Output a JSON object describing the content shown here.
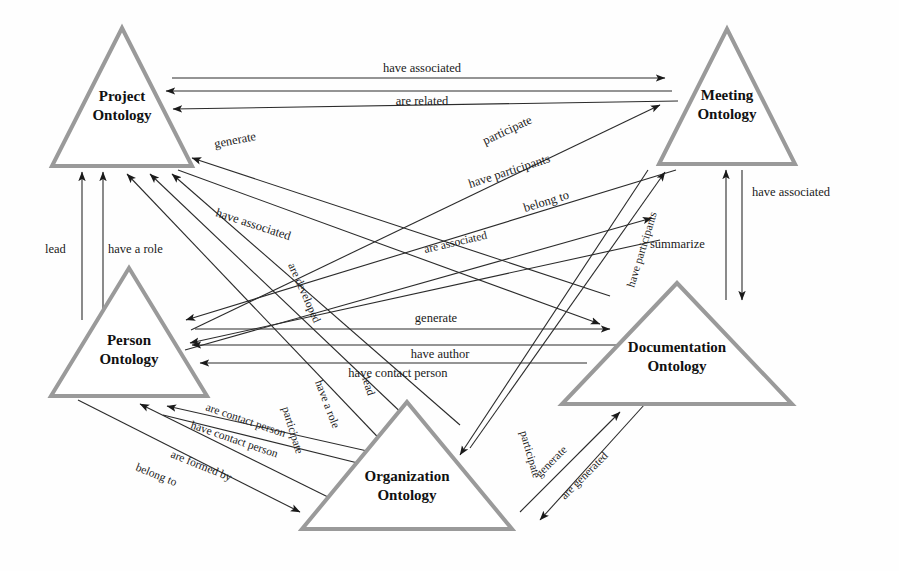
{
  "diagram": {
    "background_color": "#fefefe",
    "node_stroke_color": "#9a9a9a",
    "edge_color": "#2b2b2b",
    "nodes": [
      {
        "id": "project",
        "line1": "Project",
        "line2": "Ontology",
        "apex_x": 122,
        "apex_y": 28,
        "base_y": 166,
        "half_width": 70
      },
      {
        "id": "meeting",
        "line1": "Meeting",
        "line2": "Ontology",
        "apex_x": 727,
        "apex_y": 29,
        "base_y": 164,
        "half_width": 68
      },
      {
        "id": "person",
        "line1": "Person",
        "line2": "Ontology",
        "apex_x": 129,
        "apex_y": 268,
        "base_y": 396,
        "half_width": 78
      },
      {
        "id": "documentation",
        "line1": "Documentation",
        "line2": "Ontology",
        "apex_x": 677,
        "apex_y": 283,
        "base_y": 404,
        "half_width": 115
      },
      {
        "id": "organization",
        "line1": "Organization",
        "line2": "Ontology",
        "apex_x": 407,
        "apex_y": 402,
        "base_y": 529,
        "half_width": 105
      }
    ],
    "edges": [
      {
        "id": "project-meeting-have-associated",
        "label": "have associated",
        "from": "project",
        "to": "meeting",
        "direction": "forward"
      },
      {
        "id": "meeting-project-are-related",
        "label": "are related",
        "from": "meeting",
        "to": "project",
        "direction": "forward"
      },
      {
        "id": "meeting-project-generate",
        "label": "generate",
        "from": "meeting",
        "to": "project",
        "direction": "forward"
      },
      {
        "id": "docs-project-have-associated",
        "label": "have associated",
        "from": "documentation",
        "to": "project",
        "direction": "forward"
      },
      {
        "id": "project-docs-are-developed",
        "label": "are developed",
        "from": "project",
        "to": "documentation",
        "direction": "forward"
      },
      {
        "id": "person-meeting-participate",
        "label": "participate",
        "from": "person",
        "to": "meeting",
        "direction": "forward"
      },
      {
        "id": "meeting-person-have-participants",
        "label": "have participants",
        "from": "meeting",
        "to": "person",
        "direction": "forward"
      },
      {
        "id": "person-meeting-belong-to",
        "label": "belong to",
        "from": "person",
        "to": "meeting",
        "direction": "forward"
      },
      {
        "id": "meeting-person-are-associated",
        "label": "are associated",
        "from": "meeting",
        "to": "person",
        "direction": "forward"
      },
      {
        "id": "org-meeting-have-participants",
        "label": "have participants",
        "from": "organization",
        "to": "meeting",
        "direction": "forward"
      },
      {
        "id": "docs-meeting-summarize",
        "label": "summarize",
        "from": "documentation",
        "to": "meeting",
        "direction": "forward"
      },
      {
        "id": "meeting-docs-have-associated",
        "label": "have associated",
        "from": "meeting",
        "to": "documentation",
        "direction": "forward"
      },
      {
        "id": "person-docs-generate",
        "label": "generate",
        "from": "person",
        "to": "documentation",
        "direction": "forward"
      },
      {
        "id": "docs-person-have-author",
        "label": "have author",
        "from": "documentation",
        "to": "person",
        "direction": "forward"
      },
      {
        "id": "docs-person-have-contact-person",
        "label": "have contact person",
        "from": "documentation",
        "to": "person",
        "direction": "forward"
      },
      {
        "id": "person-project-lead",
        "label": "lead",
        "from": "person",
        "to": "project",
        "direction": "forward"
      },
      {
        "id": "person-project-have-a-role",
        "label": "have a role",
        "from": "person",
        "to": "project",
        "direction": "forward"
      },
      {
        "id": "org-project-have-a-role",
        "label": "have a role",
        "from": "organization",
        "to": "project",
        "direction": "forward"
      },
      {
        "id": "org-project-lead",
        "label": "lead",
        "from": "organization",
        "to": "project",
        "direction": "forward"
      },
      {
        "id": "org-person-are-contact-person",
        "label": "are contact person",
        "from": "organization",
        "to": "person",
        "direction": "forward"
      },
      {
        "id": "person-org-have-contact-person",
        "label": "have contact person",
        "from": "person",
        "to": "organization",
        "direction": "forward"
      },
      {
        "id": "org-person-are-formed-by",
        "label": "are formed by",
        "from": "organization",
        "to": "person",
        "direction": "forward"
      },
      {
        "id": "person-org-belong-to",
        "label": "belong to",
        "from": "person",
        "to": "organization",
        "direction": "forward"
      },
      {
        "id": "org-docs-participate",
        "label": "participate",
        "from": "organization",
        "to": "documentation",
        "direction": "forward"
      },
      {
        "id": "docs-org-participate",
        "label": "participate",
        "from": "documentation",
        "to": "organization",
        "direction": "forward"
      },
      {
        "id": "org-docs-generate",
        "label": "generate",
        "from": "organization",
        "to": "documentation",
        "direction": "forward"
      },
      {
        "id": "docs-org-are-generated",
        "label": "are generated",
        "from": "documentation",
        "to": "organization",
        "direction": "forward"
      }
    ],
    "labels": {
      "have_associated": "have associated",
      "are_related": "are related",
      "generate": "generate",
      "are_developed": "are developed",
      "participate": "participate",
      "have_participants": "have participants",
      "belong_to": "belong to",
      "are_associated": "are associated",
      "summarize": "summarize",
      "have_author": "have author",
      "have_contact_person": "have contact person",
      "are_contact_person": "are contact person",
      "are_formed_by": "are formed by",
      "lead": "lead",
      "have_a_role": "have a role",
      "are_generated": "are generated"
    }
  }
}
